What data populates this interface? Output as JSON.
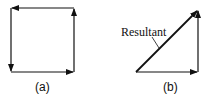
{
  "diagram": {
    "panel_a": {
      "caption": "(a)",
      "description": "Four vectors head-to-tail forming a closed square"
    },
    "panel_b": {
      "caption": "(b)",
      "resultant_label": "Resultant",
      "description": "Two perpendicular vectors with diagonal resultant"
    },
    "colors": {
      "line": "#111111",
      "background": "#ffffff"
    }
  }
}
